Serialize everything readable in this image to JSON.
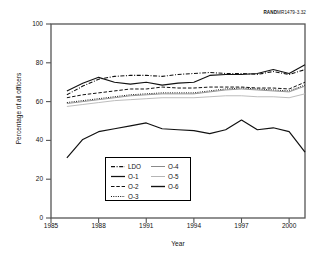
{
  "rand_id": {
    "bold": "RAND",
    "rest": "MR1479-3.32"
  },
  "chart_data": {
    "type": "line",
    "title": "",
    "xlabel": "Year",
    "ylabel": "Percentage of all officers",
    "xlim": [
      1985,
      2001
    ],
    "ylim": [
      0,
      100
    ],
    "grid": false,
    "legend_position": "inside-bottom-left",
    "xticks": [
      1985,
      1988,
      1991,
      1994,
      1997,
      2000
    ],
    "yticks": [
      0,
      20,
      40,
      60,
      80,
      100
    ],
    "x": [
      1986,
      1987,
      1988,
      1989,
      1990,
      1991,
      1992,
      1993,
      1994,
      1995,
      1996,
      1997,
      1998,
      1999,
      2000,
      2001
    ],
    "series": [
      {
        "name": "LDO",
        "style": "dash-dot",
        "color": "#111111",
        "width": 1.1,
        "values": [
          63.5,
          68.0,
          71.5,
          73.0,
          73.5,
          73.5,
          73.0,
          74.0,
          74.5,
          75.0,
          74.5,
          74.5,
          74.0,
          75.5,
          74.0,
          76.5
        ]
      },
      {
        "name": "O-1",
        "style": "solid",
        "color": "#111111",
        "width": 1.1,
        "values": [
          65.5,
          69.5,
          72.5,
          70.0,
          69.0,
          70.0,
          68.5,
          69.5,
          70.0,
          73.5,
          74.0,
          74.0,
          74.5,
          76.5,
          74.5,
          79.0
        ]
      },
      {
        "name": "O-2",
        "style": "dashed",
        "color": "#111111",
        "width": 1.0,
        "values": [
          62.0,
          63.5,
          64.5,
          65.5,
          66.5,
          66.5,
          67.5,
          67.0,
          67.0,
          67.5,
          67.5,
          67.5,
          67.0,
          67.0,
          66.5,
          70.0
        ]
      },
      {
        "name": "O-3",
        "style": "dotted",
        "color": "#111111",
        "width": 1.0,
        "values": [
          59.5,
          60.5,
          61.5,
          62.5,
          63.5,
          64.0,
          64.5,
          64.5,
          64.5,
          65.5,
          66.5,
          67.0,
          66.5,
          66.0,
          65.5,
          68.5
        ]
      },
      {
        "name": "O-4",
        "style": "solid",
        "color": "#8a8a8a",
        "width": 0.9,
        "values": [
          59.0,
          60.0,
          61.0,
          62.0,
          63.0,
          63.5,
          64.0,
          64.0,
          64.0,
          65.0,
          66.0,
          66.5,
          66.0,
          65.5,
          65.0,
          68.0
        ]
      },
      {
        "name": "O-5",
        "style": "solid",
        "color": "#b5b5b5",
        "width": 0.9,
        "values": [
          57.5,
          58.5,
          59.5,
          60.5,
          61.0,
          61.5,
          62.0,
          62.0,
          62.0,
          62.5,
          63.0,
          63.0,
          62.5,
          62.5,
          62.0,
          64.0
        ]
      },
      {
        "name": "O-6",
        "style": "solid",
        "color": "#111111",
        "width": 1.2,
        "values": [
          31.0,
          40.5,
          44.5,
          46.0,
          47.5,
          49.0,
          46.0,
          45.5,
          45.0,
          43.5,
          45.5,
          50.5,
          45.5,
          46.5,
          44.5,
          34.0
        ]
      }
    ]
  }
}
